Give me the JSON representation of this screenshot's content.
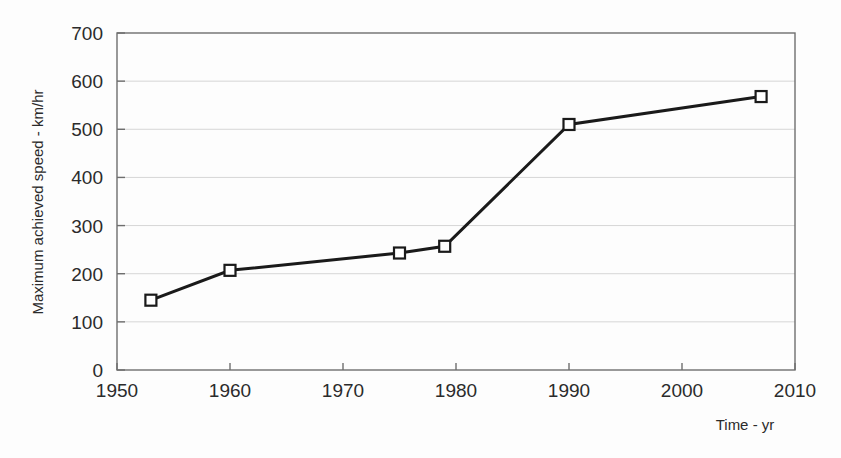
{
  "chart_data": {
    "type": "line",
    "title": "",
    "subtitle": "",
    "xlabel": "Time - yr",
    "ylabel": "Maximum achieved speed - km/hr",
    "xlim": [
      1950,
      2010
    ],
    "ylim": [
      0,
      700
    ],
    "xticks": [
      1950,
      1960,
      1970,
      1980,
      1990,
      2000,
      2010
    ],
    "xtick_labels": [
      "1950",
      "1960",
      "1970",
      "1980",
      "1990",
      "2000",
      "2010"
    ],
    "yticks": [
      0,
      100,
      200,
      300,
      400,
      500,
      600,
      700
    ],
    "ytick_labels": [
      "0",
      "100",
      "200",
      "300",
      "400",
      "500",
      "600",
      "700"
    ],
    "grid": "horizontal",
    "legend": "none",
    "annotations": [],
    "series": [
      {
        "name": "Maximum achieved speed",
        "marker": "open-square",
        "marker_fill": "#ffffff",
        "marker_edge_color": "#1a1a1a",
        "line_color": "#1a1a1a",
        "line_width": 3,
        "x": [
          1953,
          1960,
          1975,
          1979,
          1990,
          2007
        ],
        "values": [
          145,
          207,
          243,
          257,
          510,
          568
        ],
        "points": [
          {
            "x": 1953,
            "y": 145
          },
          {
            "x": 1960,
            "y": 207
          },
          {
            "x": 1975,
            "y": 243
          },
          {
            "x": 1979,
            "y": 257
          },
          {
            "x": 1990,
            "y": 510
          },
          {
            "x": 2007,
            "y": 568
          }
        ]
      }
    ],
    "colors": {
      "line": "#1a1a1a",
      "marker_edge": "#1a1a1a",
      "marker_face": "#ffffff",
      "grid": "#d6d6d6",
      "axis": "#6e6e6e",
      "text": "#2b2b2b",
      "background": "#fdfdfd"
    }
  }
}
